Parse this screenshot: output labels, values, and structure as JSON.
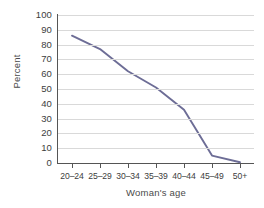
{
  "chart_data": {
    "type": "line",
    "title": "",
    "subtitle": "",
    "xlabel": "Woman's age",
    "ylabel": "Percent",
    "categories": [
      "20–24",
      "25–29",
      "30–34",
      "35–39",
      "40–44",
      "45–49",
      "50+"
    ],
    "values": [
      86,
      77,
      62,
      51,
      36,
      5,
      0.5
    ],
    "series": [
      {
        "name": "Percent",
        "values": [
          86,
          77,
          62,
          51,
          36,
          5,
          0.5
        ],
        "color": "#6d6d96"
      }
    ],
    "ylim": [
      0,
      100
    ],
    "ytick_labels": [
      "100",
      "90",
      "80",
      "70",
      "60",
      "50",
      "40",
      "30",
      "20",
      "10",
      "0"
    ],
    "ytick_values": [
      100,
      90,
      80,
      70,
      60,
      50,
      40,
      30,
      20,
      10,
      0
    ],
    "grid": "horizontal",
    "legend": "none",
    "annotations": [],
    "colors": {
      "line": "#6d6d96",
      "gridline": "#d9d9d9",
      "axis": "#555555",
      "text": "#3d3d3d",
      "background": "#ffffff"
    }
  }
}
